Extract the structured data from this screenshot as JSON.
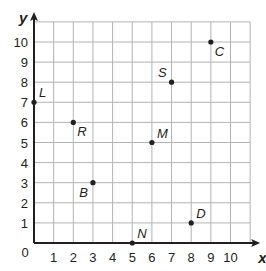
{
  "chart_data": {
    "type": "scatter",
    "title": "",
    "xlabel": "x",
    "ylabel": "y",
    "xlim": [
      0,
      11
    ],
    "ylim": [
      0,
      11
    ],
    "grid": true,
    "legend": null,
    "x_ticks": [
      "0",
      "1",
      "2",
      "3",
      "4",
      "5",
      "6",
      "7",
      "8",
      "9",
      "10"
    ],
    "y_ticks": [
      "1",
      "2",
      "3",
      "4",
      "5",
      "6",
      "7",
      "8",
      "9",
      "10"
    ],
    "points": [
      {
        "label": "L",
        "x": 0,
        "y": 7,
        "label_pos": "upper-right"
      },
      {
        "label": "R",
        "x": 2,
        "y": 6,
        "label_pos": "lower-right"
      },
      {
        "label": "B",
        "x": 3,
        "y": 3,
        "label_pos": "lower-left"
      },
      {
        "label": "N",
        "x": 5,
        "y": 0,
        "label_pos": "upper-right"
      },
      {
        "label": "M",
        "x": 6,
        "y": 5,
        "label_pos": "upper-right"
      },
      {
        "label": "S",
        "x": 7,
        "y": 8,
        "label_pos": "upper-left"
      },
      {
        "label": "D",
        "x": 8,
        "y": 1,
        "label_pos": "upper-right"
      },
      {
        "label": "C",
        "x": 9,
        "y": 10,
        "label_pos": "lower-right"
      }
    ]
  },
  "colors": {
    "grid": "#b3b3b3",
    "axis": "#231f20",
    "point": "#231f20",
    "background": "#ffffff"
  }
}
